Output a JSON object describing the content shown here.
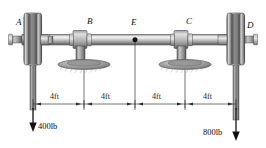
{
  "figure": {
    "type": "engineering-free-body-diagram",
    "background_color": "#ffffff",
    "line_color": "#1a1a1a",
    "metal_light": "#e3e3e3",
    "metal_mid": "#9a9a9a",
    "metal_dark": "#5f5f5f",
    "width": 266,
    "height": 148
  },
  "points": [
    {
      "id": "A",
      "label": "A",
      "kind": "pulley",
      "x": 33,
      "label_x": 16,
      "label_y": 21
    },
    {
      "id": "B",
      "label": "B",
      "kind": "bearing",
      "x": 84,
      "label_x": 86,
      "label_y": 21
    },
    {
      "id": "E",
      "label": "E",
      "kind": "marker",
      "x": 135,
      "label_x": 131,
      "label_y": 21
    },
    {
      "id": "C",
      "label": "C",
      "kind": "bearing",
      "x": 185,
      "label_x": 187,
      "label_y": 21
    },
    {
      "id": "D",
      "label": "D",
      "kind": "pulley",
      "x": 236,
      "label_x": 246,
      "label_y": 24
    }
  ],
  "dimensions": {
    "line_y": 104,
    "tick_xs": [
      33,
      84,
      135,
      185,
      236
    ],
    "segments": [
      {
        "label": "4ft",
        "from": "A",
        "to": "B",
        "center_x": 58,
        "text_y": 95
      },
      {
        "label": "4ft",
        "from": "B",
        "to": "E",
        "center_x": 109,
        "text_y": 95
      },
      {
        "label": "4ft",
        "from": "E",
        "to": "C",
        "center_x": 160,
        "text_y": 95
      },
      {
        "label": "4ft",
        "from": "C",
        "to": "D",
        "center_x": 211,
        "text_y": 95
      }
    ]
  },
  "forces": [
    {
      "id": "load-A",
      "label": "400lb",
      "magnitude": 400,
      "unit": "lb",
      "at_point": "A",
      "direction": "down",
      "x": 33,
      "arrow_tip_y": 130,
      "text_x": 40,
      "text_y": 126
    },
    {
      "id": "load-D",
      "label": "800lb",
      "magnitude": 800,
      "unit": "lb",
      "at_point": "D",
      "direction": "down",
      "x": 236,
      "arrow_tip_y": 140,
      "text_x": 204,
      "text_y": 131
    }
  ]
}
